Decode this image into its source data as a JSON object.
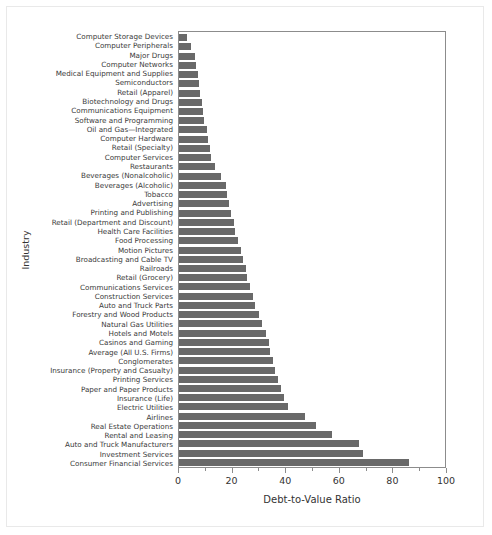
{
  "chart_data": {
    "type": "bar",
    "orientation": "horizontal",
    "title": "",
    "xlabel": "Debt-to-Value Ratio",
    "ylabel": "Industry",
    "xlim": [
      0,
      100
    ],
    "xticks": [
      0,
      20,
      40,
      60,
      80,
      100
    ],
    "xtick_labels": [
      "0",
      "20",
      "40",
      "60",
      "80",
      "100"
    ],
    "grid": false,
    "legend": "none",
    "bar_color": "#696969",
    "axis_color": "#8c8c8c",
    "categories": [
      "Computer Storage Devices",
      "Computer Peripherals",
      "Major Drugs",
      "Computer Networks",
      "Medical Equipment and Supplies",
      "Semiconductors",
      "Retail (Apparel)",
      "Biotechnology and Drugs",
      "Communications Equipment",
      "Software and Programming",
      "Oil and Gas—Integrated",
      "Computer Hardware",
      "Retail (Specialty)",
      "Computer Services",
      "Restaurants",
      "Beverages (Nonalcoholic)",
      "Beverages (Alcoholic)",
      "Tobacco",
      "Advertising",
      "Printing and Publishing",
      "Retail (Department and Discount)",
      "Health Care Facilities",
      "Food Processing",
      "Motion Pictures",
      "Broadcasting and Cable TV",
      "Railroads",
      "Retail (Grocery)",
      "Communications Services",
      "Construction Services",
      "Auto and Truck Parts",
      "Forestry and Wood Products",
      "Natural Gas Utilities",
      "Hotels and Motels",
      "Casinos and Gaming",
      "Average (All U.S. Firms)",
      "Conglomerates",
      "Insurance (Property and Casualty)",
      "Printing Services",
      "Paper and Paper Products",
      "Insurance (Life)",
      "Electric Utilities",
      "Airlines",
      "Real Estate Operations",
      "Rental and Leasing",
      "Auto and Truck Manufacturers",
      "Investment Services",
      "Consumer Financial Services"
    ],
    "values": [
      3,
      4.5,
      6,
      6.5,
      7,
      7.5,
      8,
      8.5,
      9,
      9.5,
      10.5,
      11,
      11.5,
      12,
      13.5,
      15.5,
      17.5,
      18,
      18.5,
      19.5,
      20.5,
      21,
      22,
      23,
      24,
      25,
      25.5,
      26.5,
      27.5,
      28.5,
      30,
      31,
      32.5,
      33.5,
      34,
      35,
      36,
      37,
      38,
      39,
      40.5,
      47,
      51,
      57,
      67,
      68.5,
      86
    ]
  }
}
